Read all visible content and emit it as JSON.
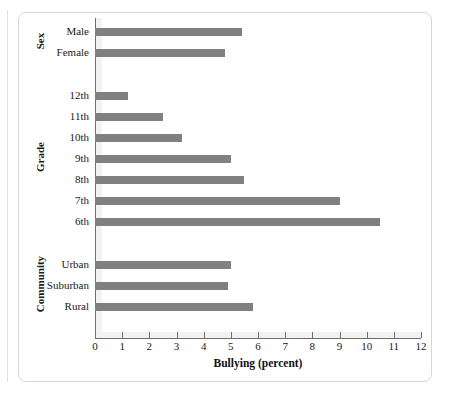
{
  "chart_data": {
    "type": "bar",
    "orientation": "horizontal",
    "title": "",
    "xlabel": "Bullying (percent)",
    "ylabel": "",
    "xlim": [
      0,
      12
    ],
    "xticks": [
      0,
      1,
      2,
      3,
      4,
      5,
      6,
      7,
      8,
      9,
      10,
      11,
      12
    ],
    "grid": false,
    "legend": null,
    "bar_color": "#808080",
    "groups": [
      {
        "name": "Sex",
        "categories": [
          "Male",
          "Female"
        ],
        "values": [
          5.4,
          4.8
        ]
      },
      {
        "name": "Grade",
        "categories": [
          "12th",
          "11th",
          "10th",
          "9th",
          "8th",
          "7th",
          "6th"
        ],
        "values": [
          1.2,
          2.5,
          3.2,
          5.0,
          5.5,
          9.0,
          10.5
        ]
      },
      {
        "name": "Community",
        "categories": [
          "Urban",
          "Suburban",
          "Rural"
        ],
        "values": [
          5.0,
          4.9,
          5.8
        ]
      }
    ]
  },
  "axis": {
    "x_title": "Bullying (percent)",
    "tick_labels": [
      "0",
      "1",
      "2",
      "3",
      "4",
      "5",
      "6",
      "7",
      "8",
      "9",
      "10",
      "11",
      "12"
    ]
  },
  "group_labels": [
    "Sex",
    "Grade",
    "Community"
  ]
}
